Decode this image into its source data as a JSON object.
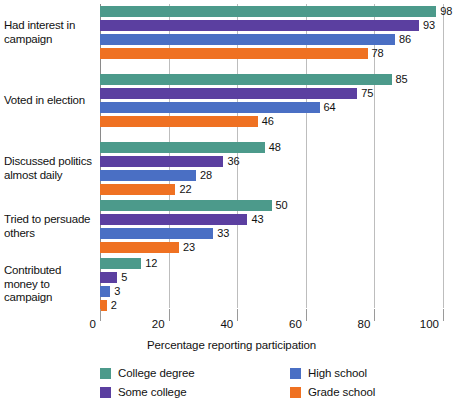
{
  "chart_data": {
    "type": "bar",
    "orientation": "horizontal",
    "title": "",
    "xlabel": "Percentage reporting participation",
    "ylabel": "",
    "xlim": [
      0,
      100
    ],
    "xticks": [
      0,
      20,
      40,
      60,
      80,
      100
    ],
    "grid": true,
    "legend_position": "bottom",
    "categories": [
      "Had interest in campaign",
      "Voted in election",
      "Discussed politics almost daily",
      "Tried to persuade others",
      "Contributed money to campaign"
    ],
    "category_lines": [
      [
        "Had interest in",
        "campaign"
      ],
      [
        "Voted in election"
      ],
      [
        "Discussed politics",
        "almost daily"
      ],
      [
        "Tried to persuade",
        "others"
      ],
      [
        "Contributed",
        "money to",
        "campaign"
      ]
    ],
    "series": [
      {
        "name": "College degree",
        "color": "#4c9a8b",
        "values": [
          98,
          85,
          48,
          50,
          12
        ]
      },
      {
        "name": "Some college",
        "color": "#5b3fa0",
        "values": [
          93,
          75,
          36,
          43,
          5
        ]
      },
      {
        "name": "High school",
        "color": "#4a6fc4",
        "values": [
          86,
          64,
          28,
          33,
          3
        ]
      },
      {
        "name": "Grade school",
        "color": "#ef7122",
        "values": [
          78,
          46,
          22,
          23,
          2
        ]
      }
    ]
  },
  "axis": {
    "tick_labels": [
      "0",
      "20",
      "40",
      "60",
      "80",
      "100"
    ],
    "x_title": "Percentage reporting participation"
  },
  "legend": {
    "items": [
      {
        "label": "College degree",
        "color": "#4c9a8b"
      },
      {
        "label": "Some college",
        "color": "#5b3fa0"
      },
      {
        "label": "High school",
        "color": "#4a6fc4"
      },
      {
        "label": "Grade school",
        "color": "#ef7122"
      }
    ]
  }
}
